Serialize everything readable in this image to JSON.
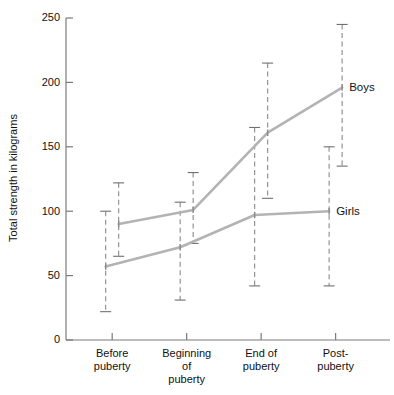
{
  "chart_data": {
    "type": "line",
    "title": "",
    "subtitle": "",
    "xlabel": "",
    "ylabel": "Total strength in kilograms",
    "ylim": [
      0,
      250
    ],
    "yticks": [
      0,
      50,
      100,
      150,
      200,
      250
    ],
    "ytick_labels": [
      "0",
      "50",
      "100",
      "150",
      "200",
      "250"
    ],
    "grid": false,
    "legend_position": "right-inline-labels",
    "categories": [
      "Before\npuberty",
      "Beginning\nof\npuberty",
      "End of\npuberty",
      "Post-\npuberty"
    ],
    "category_lines": [
      [
        "Before",
        "puberty"
      ],
      [
        "Beginning",
        "of",
        "puberty"
      ],
      [
        "End of",
        "puberty"
      ],
      [
        "Post-",
        "puberty"
      ]
    ],
    "series": [
      {
        "name": "Boys",
        "color": "#b3b3b3",
        "values": [
          90,
          101,
          161,
          196
        ],
        "error_low": [
          65,
          75,
          110,
          135
        ],
        "error_high": [
          122,
          130,
          215,
          245
        ]
      },
      {
        "name": "Girls",
        "color": "#b3b3b3",
        "values": [
          57,
          72,
          97,
          100
        ],
        "error_low": [
          22,
          31,
          42,
          42
        ],
        "error_high": [
          100,
          107,
          165,
          150
        ]
      }
    ],
    "annotations": [
      {
        "text": "Boys",
        "series": "Boys",
        "at_category": "Post-\npuberty"
      },
      {
        "text": "Girls",
        "series": "Girls",
        "at_category": "Post-\npuberty"
      }
    ]
  }
}
